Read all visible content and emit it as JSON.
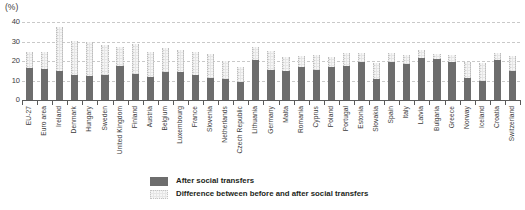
{
  "chart_data": {
    "type": "bar",
    "title": "",
    "subtitle": "",
    "unit_label": "(%)",
    "xlabel": "",
    "ylabel": "",
    "ylim": [
      0,
      40
    ],
    "yticks": [
      0,
      10,
      20,
      30,
      40
    ],
    "ytick_labels": [
      "0",
      "10",
      "20",
      "30",
      "40"
    ],
    "grid": true,
    "stacked": true,
    "legend_position": "bottom-center",
    "categories": [
      "EU-27",
      "Euro area",
      "Ireland",
      "Denmark",
      "Hungary",
      "Sweden",
      "United Kingdom",
      "Finland",
      "Austria",
      "Belgium",
      "Luxembourg",
      "France",
      "Slovenia",
      "Netherlands",
      "Czech Republic",
      "Lithuania",
      "Germany",
      "Malta",
      "Romania",
      "Cyprus",
      "Poland",
      "Portugal",
      "Estonia",
      "Slovakia",
      "Spain",
      "Italy",
      "Latvia",
      "Bulgaria",
      "Greece",
      "Norway",
      "Iceland",
      "Croatia",
      "Switzerland"
    ],
    "series": [
      {
        "name": "After social transfers",
        "color": "#6d6d6d",
        "values": [
          16.5,
          16.0,
          15.0,
          13.0,
          12.5,
          13.0,
          17.5,
          13.5,
          12.0,
          14.5,
          14.5,
          13.0,
          11.5,
          11.0,
          9.0,
          20.5,
          15.5,
          15.0,
          17.0,
          15.5,
          17.0,
          17.5,
          19.5,
          11.0,
          19.5,
          18.5,
          21.5,
          21.0,
          19.5,
          11.5,
          10.0,
          20.5,
          15.0
        ]
      },
      {
        "name": "Difference between before and after social transfers",
        "color": "#e6e6e6",
        "values": [
          8.0,
          8.5,
          22.5,
          17.5,
          17.5,
          15.0,
          9.5,
          15.0,
          12.5,
          12.0,
          11.0,
          11.5,
          12.0,
          9.0,
          8.0,
          6.5,
          9.5,
          7.0,
          5.5,
          7.5,
          5.0,
          6.5,
          4.5,
          8.0,
          4.5,
          4.5,
          4.0,
          2.5,
          3.5,
          8.0,
          9.0,
          3.5,
          7.5
        ]
      }
    ],
    "totals": [
      24.5,
      24.5,
      37.5,
      30.5,
      30.0,
      28.0,
      27.0,
      28.5,
      24.5,
      26.5,
      25.5,
      24.5,
      23.5,
      20.0,
      17.0,
      27.0,
      25.0,
      22.0,
      22.5,
      23.0,
      22.0,
      24.0,
      24.0,
      19.0,
      24.0,
      23.0,
      25.5,
      23.5,
      23.0,
      19.5,
      19.0,
      24.0,
      22.5
    ],
    "legend": [
      {
        "label": "After social transfers",
        "swatch": "after"
      },
      {
        "label": "Difference between before and after social transfers",
        "swatch": "diff"
      }
    ]
  }
}
